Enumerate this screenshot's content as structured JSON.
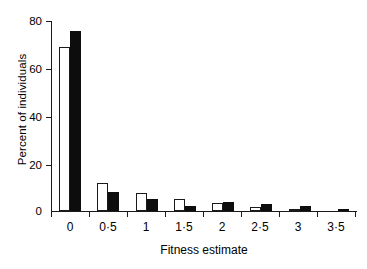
{
  "chart_data": {
    "type": "bar",
    "title": "",
    "xlabel": "Fitness estimate",
    "ylabel": "Percent of individuals",
    "categories": [
      "0",
      "0·5",
      "1",
      "1·5",
      "2",
      "2·5",
      "3",
      "3·5"
    ],
    "series": [
      {
        "name": "open",
        "style": "white bar with black outline",
        "color": "#ffffff",
        "edge_color": "#1a1a1a",
        "values": [
          69,
          12,
          7.5,
          5,
          3.5,
          1.5,
          0.7,
          0
        ]
      },
      {
        "name": "filled",
        "style": "solid black bar",
        "color": "#0d0d0d",
        "edge_color": "#0d0d0d",
        "values": [
          76,
          8,
          5,
          2,
          4,
          3,
          2,
          1
        ]
      }
    ],
    "ylim": [
      0,
      80
    ],
    "yticks": [
      0,
      20,
      40,
      60,
      80
    ],
    "ytick_labels": [
      "0",
      "20",
      "40",
      "60",
      "80"
    ],
    "grid": false,
    "legend": "none"
  },
  "axes": {
    "y_tick_labels": [
      "80",
      "60",
      "40",
      "20",
      "0"
    ],
    "x_tick_labels": [
      "0",
      "0·5",
      "1",
      "1·5",
      "2",
      "2·5",
      "3",
      "3·5"
    ],
    "y_title": "Percent of individuals",
    "x_title": "Fitness estimate"
  }
}
